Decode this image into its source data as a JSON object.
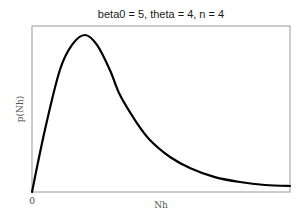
{
  "chart_data": {
    "type": "line",
    "title": "beta0 = 5, theta = 4, n = 4",
    "xlabel": "Nh",
    "ylabel": "p(Nh)",
    "x_tick_labels": [
      "0"
    ],
    "y_tick_labels": [],
    "grid": false,
    "legend": null,
    "xlim": [
      0,
      10
    ],
    "ylim": [
      0,
      1
    ],
    "series": [
      {
        "name": "p(Nh)",
        "color": "#000000",
        "x": [
          0,
          0.5,
          1.08,
          1.55,
          2.05,
          2.52,
          3.02,
          3.41,
          3.99,
          4.57,
          5.35,
          6.12,
          7.09,
          8.06,
          9.03,
          10.0
        ],
        "values": [
          0,
          0.373,
          0.735,
          0.886,
          0.946,
          0.886,
          0.735,
          0.584,
          0.434,
          0.313,
          0.211,
          0.145,
          0.09,
          0.06,
          0.042,
          0.036
        ]
      }
    ]
  },
  "plot": {
    "title": "beta0 = 5, theta = 4, n = 4",
    "xlabel": "Nh",
    "ylabel": "p(Nh)",
    "x_origin_label": "0"
  }
}
